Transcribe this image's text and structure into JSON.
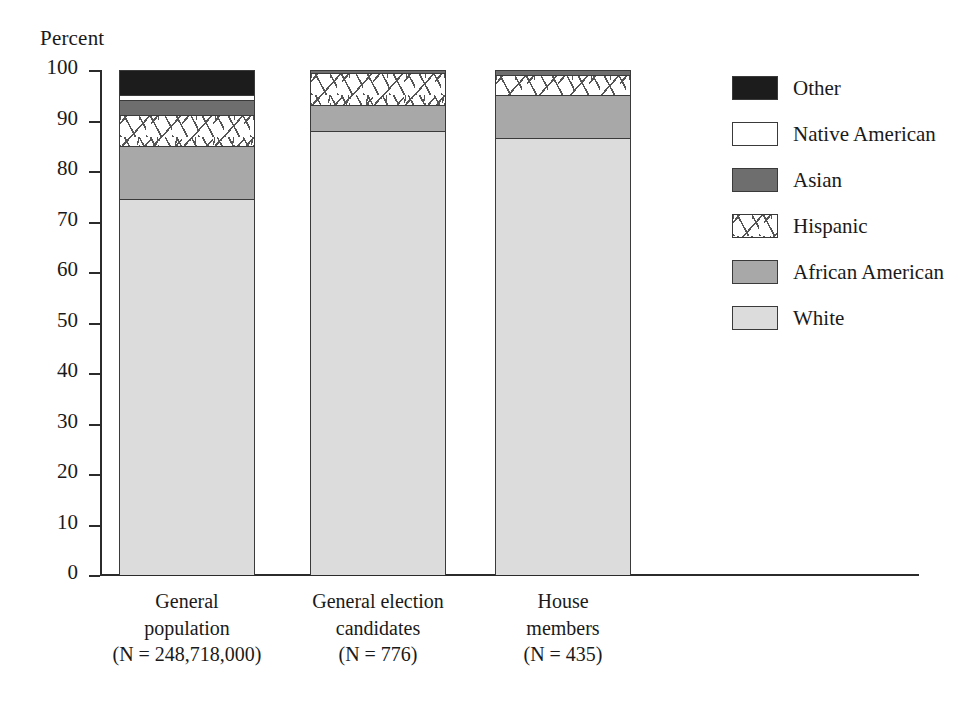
{
  "chart_data": {
    "type": "bar",
    "subtype": "stacked-bar-100",
    "title": "",
    "xlabel": "",
    "ylabel": "Percent",
    "ylim": [
      0,
      100
    ],
    "grid": false,
    "legend_position": "right",
    "y_ticks": [
      "100",
      "90",
      "80",
      "70",
      "60",
      "50",
      "40",
      "30",
      "20",
      "10",
      "0"
    ],
    "categories": [
      "General population (N = 248,718,000)",
      "General election candidates (N = 776)",
      "House members (N = 435)"
    ],
    "category_labels": [
      [
        "General",
        "population",
        "(N = 248,718,000)"
      ],
      [
        "General election",
        "candidates",
        "(N = 776)"
      ],
      [
        "House",
        "members",
        "(N = 435)"
      ]
    ],
    "series": [
      {
        "name": "White",
        "values": [
          74.5,
          88.0,
          86.5
        ],
        "color": "#dcdcdc",
        "pattern": "solid"
      },
      {
        "name": "African American",
        "values": [
          10.5,
          5.0,
          8.5
        ],
        "color": "#a8a8a8",
        "pattern": "solid"
      },
      {
        "name": "Hispanic",
        "values": [
          6.0,
          6.5,
          4.0
        ],
        "color": "#ffffff",
        "pattern": "hatched"
      },
      {
        "name": "Asian",
        "values": [
          3.0,
          0.5,
          1.0
        ],
        "color": "#6e6e6e",
        "pattern": "solid"
      },
      {
        "name": "Native American",
        "values": [
          1.0,
          0.0,
          0.0
        ],
        "color": "#ffffff",
        "pattern": "solid"
      },
      {
        "name": "Other",
        "values": [
          5.0,
          0.0,
          0.0
        ],
        "color": "#1c1c1c",
        "pattern": "solid"
      }
    ],
    "legend_entries": [
      {
        "label": "Other",
        "swatch": "other-swatch"
      },
      {
        "label": "Native American",
        "swatch": "native-american-swatch"
      },
      {
        "label": "Asian",
        "swatch": "asian-swatch"
      },
      {
        "label": "Hispanic",
        "swatch": "hispanic-swatch"
      },
      {
        "label": "African American",
        "swatch": "african-american-swatch"
      },
      {
        "label": "White",
        "swatch": "white-swatch"
      }
    ]
  }
}
